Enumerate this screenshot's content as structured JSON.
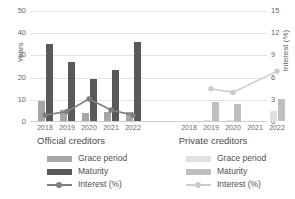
{
  "chart_data": {
    "type": "bar",
    "title": "",
    "xlabel": "",
    "ylabel": "Years",
    "y2label": "Interest (%)",
    "ylim": [
      0,
      50
    ],
    "y2lim": [
      0,
      15
    ],
    "yticks": [
      0,
      10,
      20,
      30,
      40,
      50
    ],
    "y2ticks": [
      0,
      3,
      6,
      9,
      12,
      15
    ],
    "grid": true,
    "legend_position": "bottom",
    "groups": [
      {
        "name": "Official creditors",
        "categories": [
          "2018",
          "2019",
          "2020",
          "2021",
          "2022"
        ],
        "series": [
          {
            "name": "Grace period",
            "axis": "left",
            "type": "bar",
            "color": "#a6a6a6",
            "values": [
              9.0,
              5.2,
              3.6,
              4.2,
              4.1
            ]
          },
          {
            "name": "Maturity",
            "axis": "left",
            "type": "bar",
            "color": "#595959",
            "values": [
              35.0,
              26.8,
              19.2,
              23.0,
              36.0
            ]
          },
          {
            "name": "Interest (%)",
            "axis": "right",
            "type": "line",
            "color": "#7f7f7f",
            "values": [
              0.8,
              1.3,
              3.0,
              1.5,
              0.8
            ]
          }
        ]
      },
      {
        "name": "Private creditors",
        "categories": [
          "2018",
          "2019",
          "2020",
          "2021",
          "2022"
        ],
        "series": [
          {
            "name": "Grace period",
            "axis": "left",
            "type": "bar",
            "color": "#e0e0e0",
            "values": [
              0.0,
              0.4,
              0.3,
              0.0,
              4.4
            ]
          },
          {
            "name": "Maturity",
            "axis": "left",
            "type": "bar",
            "color": "#bfbfbf",
            "values": [
              0.0,
              8.7,
              7.8,
              0.0,
              10.0
            ]
          },
          {
            "name": "Interest (%)",
            "axis": "right",
            "type": "line",
            "color": "#cccccc",
            "values": [
              null,
              4.4,
              3.9,
              null,
              6.8
            ]
          }
        ]
      }
    ]
  },
  "axes": {
    "left": {
      "label": "Years",
      "ticks": [
        "0",
        "10",
        "20",
        "30",
        "40",
        "50"
      ]
    },
    "right": {
      "label": "Interest (%)",
      "ticks": [
        "0",
        "3",
        "6",
        "9",
        "12",
        "15"
      ]
    }
  },
  "official": {
    "title": "Official creditors",
    "years": [
      "2018",
      "2019",
      "2020",
      "2021",
      "2022"
    ],
    "legend": {
      "grace": "Grace period",
      "maturity": "Maturity",
      "interest": "Interest (%)"
    },
    "colors": {
      "grace": "#a6a6a6",
      "maturity": "#595959",
      "interest": "#7f7f7f"
    }
  },
  "private": {
    "title": "Private creditors",
    "years": [
      "2018",
      "2019",
      "2020",
      "2021",
      "2022"
    ],
    "legend": {
      "grace": "Grace period",
      "maturity": "Maturity",
      "interest": "Interest (%)"
    },
    "colors": {
      "grace": "#e0e0e0",
      "maturity": "#bfbfbf",
      "interest": "#cccccc"
    }
  }
}
